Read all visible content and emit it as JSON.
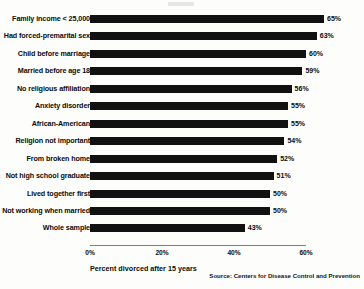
{
  "chart_data": {
    "type": "bar",
    "orientation": "horizontal",
    "title": "",
    "xlabel": "Percent divorced after 15 years",
    "ylabel": "",
    "xlim": [
      0,
      60
    ],
    "grid": false,
    "legend": null,
    "source": "Source: Centers for Disease Control and Prevention",
    "x_ticks": [
      "0%",
      "20%",
      "40%",
      "60%"
    ],
    "x_tick_values": [
      0,
      20,
      40,
      60
    ],
    "value_suffix": "%",
    "categories": [
      "Family income < 25,000",
      "Had forced-premarital sex",
      "Child before marriage",
      "Married before age 18",
      "No religious affiliation",
      "Anxiety disorder",
      "African-American",
      "Religion not important",
      "From broken home",
      "Not high school graduate",
      "Lived together first",
      "Not working when married",
      "Whole sample"
    ],
    "values": [
      65,
      63,
      60,
      59,
      56,
      55,
      55,
      54,
      52,
      51,
      50,
      50,
      43
    ],
    "value_labels": [
      "65%",
      "63%",
      "60%",
      "59%",
      "56%",
      "55%",
      "55%",
      "54%",
      "52%",
      "51%",
      "50%",
      "50%",
      "43%"
    ],
    "colors": {
      "bar": "#111111",
      "axis": "#7d7d7d",
      "text": "#0b0b0b",
      "background": "#fdfdfb"
    }
  }
}
